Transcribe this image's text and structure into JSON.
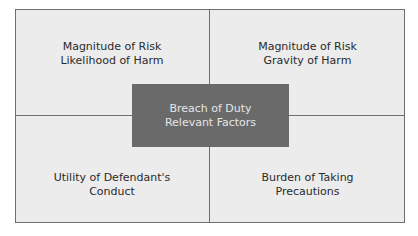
{
  "diagram": {
    "center": {
      "line1": "Breach of Duty",
      "line2": "Relevant Factors"
    },
    "quadrants": {
      "top_left": {
        "line1": "Magnitude of Risk",
        "line2": "Likelihood of Harm"
      },
      "top_right": {
        "line1": "Magnitude of Risk",
        "line2": "Gravity of Harm"
      },
      "bottom_left": {
        "line1": "Utility of Defendant's",
        "line2": "Conduct"
      },
      "bottom_right": {
        "line1": "Burden of Taking",
        "line2": "Precautions"
      }
    },
    "colors": {
      "background": "#ececec",
      "border": "#6e6e6e",
      "center_fill": "#6a6a6a",
      "center_text": "#e6e6e6",
      "quad_text": "#2a2a2a"
    }
  }
}
